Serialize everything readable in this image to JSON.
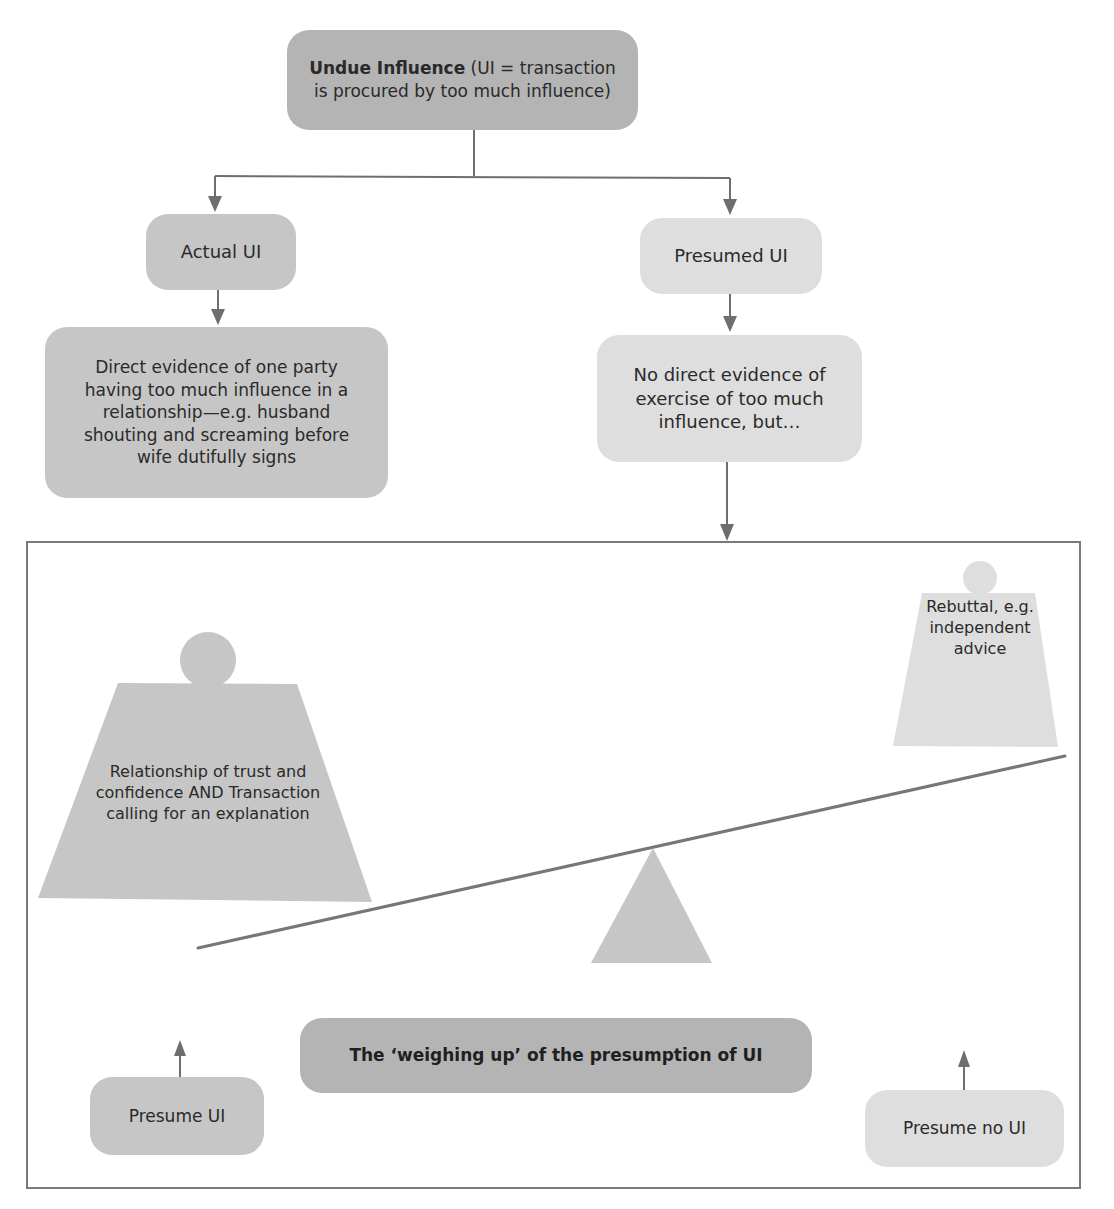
{
  "diagram": {
    "title_box": {
      "bold": "Undue Influence",
      "rest": " (UI = transaction is procured by too much influence)"
    },
    "branches": {
      "actual": {
        "label": "Actual UI",
        "detail": "Direct evidence of one party having too much influence in a relationship—e.g. husband shouting and screaming before wife dutifully signs"
      },
      "presumed": {
        "label": "Presumed UI",
        "detail": "No direct evidence of exercise of too much influence, but…"
      }
    },
    "scale": {
      "left_weight": "Relationship of trust and confidence AND Transaction calling for an explanation",
      "right_weight": "Rebuttal, e.g. independent advice",
      "caption": "The ‘weighing up’ of the presumption of UI",
      "outcome_left": "Presume UI",
      "outcome_right": "Presume no UI"
    },
    "colors": {
      "dark_box": "#b4b4b4",
      "mid_box": "#c6c6c6",
      "light_box": "#dedede",
      "lines": "#6e6e6e",
      "text": "#2a2a2a"
    }
  }
}
